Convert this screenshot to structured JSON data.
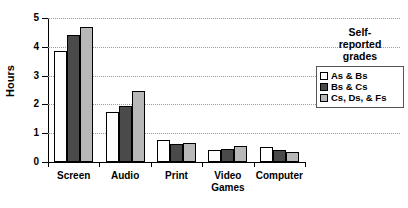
{
  "chart_data": {
    "type": "bar",
    "title": "",
    "xlabel": "",
    "ylabel": "Hours",
    "ylim": [
      0,
      5
    ],
    "yticks": [
      "0",
      "1",
      "2",
      "3",
      "4",
      "5"
    ],
    "grid": true,
    "legend_position": "right",
    "legend_title": "Self-reported grades",
    "categories": [
      "Screen",
      "Audio",
      "Print",
      "Video Games",
      "Computer"
    ],
    "category_lines": [
      [
        "Screen"
      ],
      [
        "Audio"
      ],
      [
        "Print"
      ],
      [
        "Video",
        "Games"
      ],
      [
        "Computer"
      ]
    ],
    "series": [
      {
        "name": "As & Bs",
        "color": "#ffffff",
        "values": [
          3.85,
          1.75,
          0.78,
          0.4,
          0.52
        ]
      },
      {
        "name": "Bs & Cs",
        "color": "#4a4a4a",
        "values": [
          4.4,
          1.95,
          0.62,
          0.45,
          0.42
        ]
      },
      {
        "name": "Cs, Ds, & Fs",
        "color": "#b8b8b8",
        "values": [
          4.7,
          2.45,
          0.67,
          0.55,
          0.35
        ]
      }
    ]
  },
  "legend": {
    "title_lines": [
      "Self-",
      "reported",
      "grades"
    ],
    "entries": [
      {
        "label": "As & Bs"
      },
      {
        "label": "Bs & Cs"
      },
      {
        "label": "Cs, Ds, & Fs"
      }
    ]
  },
  "axis": {
    "y_label": "Hours"
  }
}
